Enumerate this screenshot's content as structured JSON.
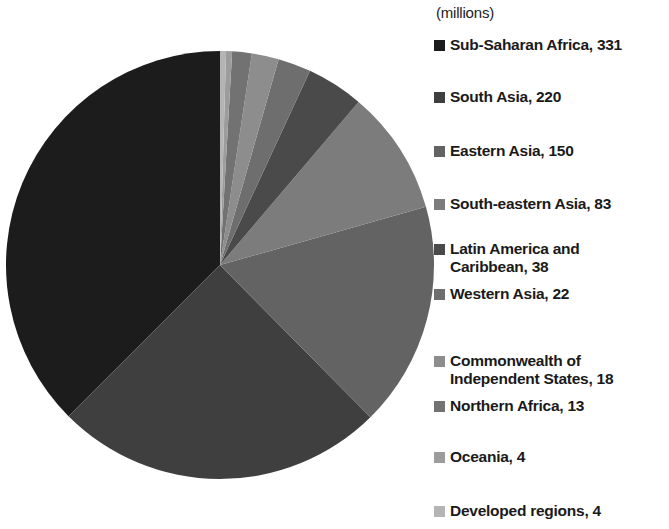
{
  "chart_data": {
    "type": "pie",
    "title": "",
    "subtitle": "",
    "units_note": "(millions)",
    "total": 883,
    "categories": [
      "Sub-Saharan Africa",
      "South Asia",
      "Eastern Asia",
      "South-eastern Asia",
      "Latin America and Caribbean",
      "Western Asia",
      "Commonwealth of Independent States",
      "Northern Africa",
      "Oceania",
      "Developed regions"
    ],
    "values": [
      331,
      220,
      150,
      83,
      38,
      22,
      18,
      13,
      4,
      4
    ],
    "colors": [
      "#1c1c1c",
      "#3f3f3f",
      "#636363",
      "#7c7c7c",
      "#4a4a4a",
      "#6e6e6e",
      "#8d8d8d",
      "#727272",
      "#9c9c9c",
      "#b4b4b4"
    ],
    "legend_position": "right",
    "grid": false,
    "xlabel": "",
    "ylabel": ""
  },
  "legend": {
    "units": "(millions)",
    "items": [
      {
        "label": "Sub-Saharan Africa, 331",
        "swatch": "#1c1c1c",
        "top": 36
      },
      {
        "label": "South Asia, 220",
        "swatch": "#3f3f3f",
        "top": 88
      },
      {
        "label": "Eastern Asia, 150",
        "swatch": "#636363",
        "top": 142
      },
      {
        "label": "South-eastern Asia, 83",
        "swatch": "#7c7c7c",
        "top": 195
      },
      {
        "label": "Latin America and\nCaribbean, 38",
        "swatch": "#4a4a4a",
        "top": 240
      },
      {
        "label": "Western Asia, 22",
        "swatch": "#6e6e6e",
        "top": 285
      },
      {
        "label": "Commonwealth of\nIndependent States, 18",
        "swatch": "#8d8d8d",
        "top": 352
      },
      {
        "label": "Northern Africa, 13",
        "swatch": "#727272",
        "top": 397
      },
      {
        "label": "Oceania, 4",
        "swatch": "#9c9c9c",
        "top": 448
      },
      {
        "label": "Developed regions, 4",
        "swatch": "#b4b4b4",
        "top": 502
      }
    ]
  },
  "pie_geometry": {
    "center_x": 220,
    "center_y": 265,
    "radius": 214,
    "start_angle_deg": 0,
    "direction": "counterclockwise"
  }
}
